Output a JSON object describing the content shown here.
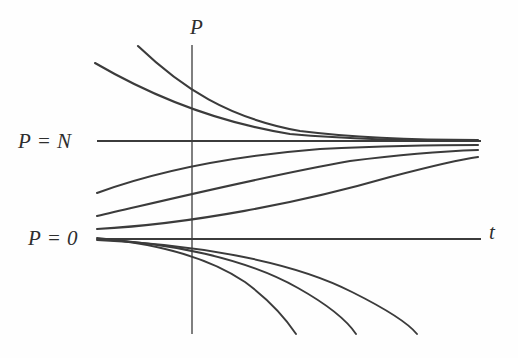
{
  "figure": {
    "domain": "diagram",
    "kind": "ordinary-differential-equation-solution-curves",
    "background_color": "#fefefe",
    "curve_color": "#3b3b3b",
    "axis_color": "#545454",
    "width": 518,
    "height": 358
  },
  "labels": {
    "vertical_axis": "P",
    "horizontal_axis": "t",
    "upper_equilibrium": "P = N",
    "lower_equilibrium": "P = 0"
  },
  "axes": {
    "vertical": {
      "x": 192,
      "y_top": 45,
      "y_bottom": 334
    },
    "horizontal": {
      "y": 239,
      "x_left": 97,
      "x_right": 481
    }
  },
  "equilibria": [
    {
      "name": "P = N",
      "y": 141,
      "x_start": 97,
      "x_end": 481
    },
    {
      "name": "P = 0",
      "y": 239,
      "x_start": 97,
      "x_end": 481
    }
  ],
  "chart_data": {
    "type": "line",
    "title": "",
    "xlabel": "t",
    "ylabel": "P",
    "grid": false,
    "legend": false,
    "annotations": [
      "P = N",
      "P = 0"
    ],
    "series": [
      {
        "name": "above-N-outer",
        "region": "P > N",
        "path": "M 95 63 C 150 95, 215 122, 290 134 C 360 140, 430 141, 478 141"
      },
      {
        "name": "above-N-inner",
        "region": "P > N",
        "path": "M 138 46 C 182 88, 228 118, 300 131 C 365 139, 432 140, 478 140"
      },
      {
        "name": "between-upper",
        "region": "0 < P < N",
        "path": "M 97 193 C 160 170, 232 156, 320 149 C 385 146, 440 145, 478 145"
      },
      {
        "name": "between-middle",
        "region": "0 < P < N",
        "path": "M 97 216 C 175 198, 265 176, 350 161 C 405 154, 450 151, 478 150"
      },
      {
        "name": "between-lower",
        "region": "0 < P < N",
        "path": "M 97 229 C 190 224, 300 203, 390 177 C 432 166, 463 159, 478 157"
      },
      {
        "name": "equilibrium-N",
        "region": "P = N",
        "path": "M 97 141 L 481 141"
      },
      {
        "name": "equilibrium-0",
        "region": "P = 0",
        "path": "M 97 239 L 481 239"
      },
      {
        "name": "below-zero-first",
        "region": "P < 0",
        "path": "M 97 238 C 150 243, 205 255, 245 282 C 272 302, 288 322, 296 334"
      },
      {
        "name": "below-zero-second",
        "region": "P < 0",
        "path": "M 97 239 C 170 243, 245 258, 298 288 C 330 306, 348 322, 356 334"
      },
      {
        "name": "below-zero-third",
        "region": "P < 0",
        "path": "M 97 240 C 190 244, 290 260, 352 292 C 390 311, 409 324, 417 334"
      }
    ]
  }
}
